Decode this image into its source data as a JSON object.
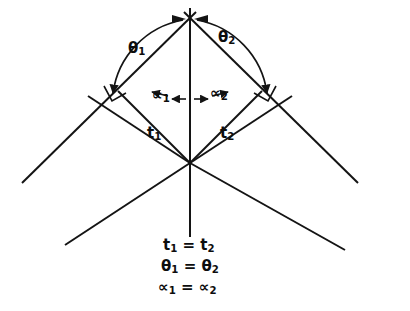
{
  "figure": {
    "stroke_color": "#141414",
    "background_color": "#ffffff"
  },
  "labels": {
    "theta1": "θ",
    "theta1_sub": "1",
    "theta2": "θ",
    "theta2_sub": "2",
    "alpha1": "∝",
    "alpha1_sub": "1",
    "alpha2": "∝",
    "alpha2_sub": "2",
    "t1": "t",
    "t1_sub": "1",
    "t2": "t",
    "t2_sub": "2"
  },
  "legend": {
    "line1_left": "t",
    "line1_left_sub": "1",
    "line1_eq": "=",
    "line1_right": "t",
    "line1_right_sub": "2",
    "line2_left": "θ",
    "line2_left_sub": "1",
    "line2_eq": "=",
    "line2_right": "θ",
    "line2_right_sub": "2",
    "line3_left": "∝",
    "line3_left_sub": "1",
    "line3_eq": "=",
    "line3_right": "∝",
    "line3_right_sub": "2"
  }
}
